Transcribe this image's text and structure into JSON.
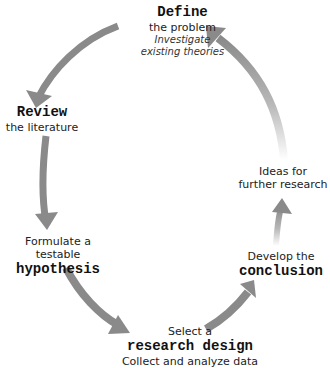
{
  "diagram": {
    "type": "research-cycle",
    "arrow_color": "#8a8a8a",
    "nodes": [
      {
        "id": "define",
        "bold": "Define",
        "line1": "the problem",
        "italic1": "Investigate",
        "italic2": "existing theories"
      },
      {
        "id": "review",
        "bold": "Review",
        "line1": "the literature"
      },
      {
        "id": "hypothesis",
        "pre": "Formulate a testable",
        "bold": "hypothesis"
      },
      {
        "id": "design",
        "pre": "Select a",
        "bold": "research design",
        "post": "Collect and analyze data"
      },
      {
        "id": "conclusion",
        "pre": "Develop the",
        "bold": "conclusion"
      },
      {
        "id": "ideas",
        "line1": "Ideas for",
        "line2": "further research"
      }
    ]
  }
}
